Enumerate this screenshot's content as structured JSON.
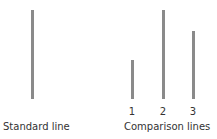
{
  "diagram": {
    "standard": {
      "label": "Standard line",
      "length": 89
    },
    "comparison": {
      "label": "Comparison lines",
      "lines": [
        {
          "number": "1",
          "length": 39
        },
        {
          "number": "2",
          "length": 89
        },
        {
          "number": "3",
          "length": 68
        }
      ]
    },
    "line_color": "#8a8a8a"
  }
}
